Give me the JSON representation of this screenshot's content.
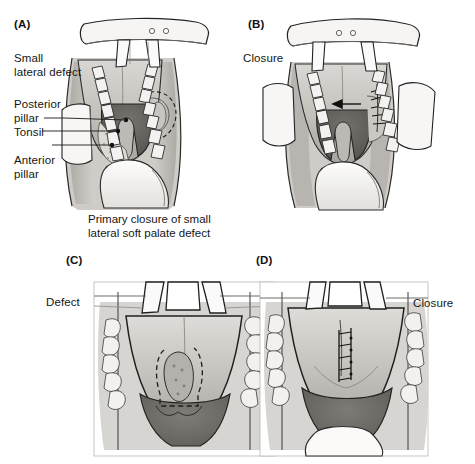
{
  "figure": {
    "background_color": "#ffffff",
    "ink_color": "#1b1b1b",
    "panel_count": 4
  },
  "panels": [
    {
      "id": "A",
      "letter": "(A)",
      "view": "Intraoral view through Dingman mouth retractor showing a small lateral soft palate defect",
      "labels": [
        {
          "name": "small-lateral-defect",
          "text": "Small\nlateral defect"
        },
        {
          "name": "posterior-pillar",
          "text": "Posterior\npillar"
        },
        {
          "name": "tonsil",
          "text": "Tonsil"
        },
        {
          "name": "anterior-pillar",
          "text": "Anterior\npillar"
        }
      ],
      "caption": "Primary closure of small\nlateral soft palate defect"
    },
    {
      "id": "B",
      "letter": "(B)",
      "view": "Intraoral view after primary closure of the lateral soft palate defect with sutures",
      "labels": [
        {
          "name": "closure",
          "text": "Closure"
        }
      ],
      "annotations": [
        {
          "name": "advancement-arrow",
          "text": ""
        },
        {
          "name": "suture-line",
          "text": ""
        }
      ]
    },
    {
      "id": "C",
      "letter": "(C)",
      "view": "Intraoral view showing a midline soft palate defect outlined by a dashed excision margin",
      "labels": [
        {
          "name": "defect",
          "text": "Defect"
        }
      ]
    },
    {
      "id": "D",
      "letter": "(D)",
      "view": "Intraoral view after midline closure with a vertical ladder suture line",
      "labels": [
        {
          "name": "closure",
          "text": "Closure"
        }
      ]
    }
  ],
  "palette": {
    "paper": "#ffffff",
    "outline": "#1f1f1f",
    "tissue_light": "#d8d6d2",
    "tissue_mid": "#b9b6b1",
    "tissue_dark": "#8e8b87",
    "oropharynx": "#6e6b68",
    "oropharynx_deep": "#57544f",
    "retractor": "#f2f1ef",
    "teeth": "#efeeec",
    "shadow": "#9a9793"
  }
}
